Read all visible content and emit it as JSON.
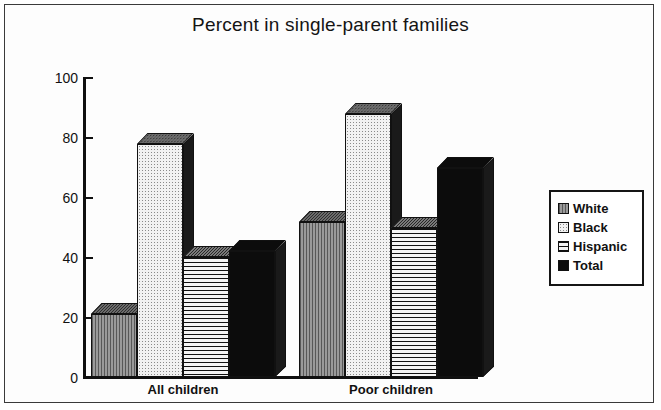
{
  "chart_data": {
    "type": "bar",
    "title": "Percent in single-parent families",
    "xlabel": "",
    "ylabel": "",
    "ylim": [
      0,
      100
    ],
    "yticks": [
      0,
      20,
      40,
      60,
      80,
      100
    ],
    "grid": false,
    "legend_position": "right",
    "categories": [
      "All children",
      "Poor children"
    ],
    "series": [
      {
        "name": "White",
        "values": [
          21,
          52
        ],
        "fill": "vertical-lines-gray"
      },
      {
        "name": "Black",
        "values": [
          78,
          88
        ],
        "fill": "light-dotted"
      },
      {
        "name": "Hispanic",
        "values": [
          40,
          50
        ],
        "fill": "horizontal-lines"
      },
      {
        "name": "Total",
        "values": [
          42,
          70
        ],
        "fill": "solid-black"
      }
    ]
  },
  "legend": {
    "items": [
      {
        "label": "White"
      },
      {
        "label": "Black"
      },
      {
        "label": "Hispanic"
      },
      {
        "label": "Total"
      }
    ]
  },
  "axis": {
    "y_tick_labels": [
      "100",
      "80",
      "60",
      "40",
      "20",
      "0"
    ]
  },
  "colors": {
    "ink": "#111111",
    "frame": "#3a3a3a",
    "background": "#ffffff",
    "white_series": "#7d7d7d",
    "black_series": "#f2f2f2",
    "hispanic_series": "#efefef",
    "total_series": "#0c0c0c"
  }
}
